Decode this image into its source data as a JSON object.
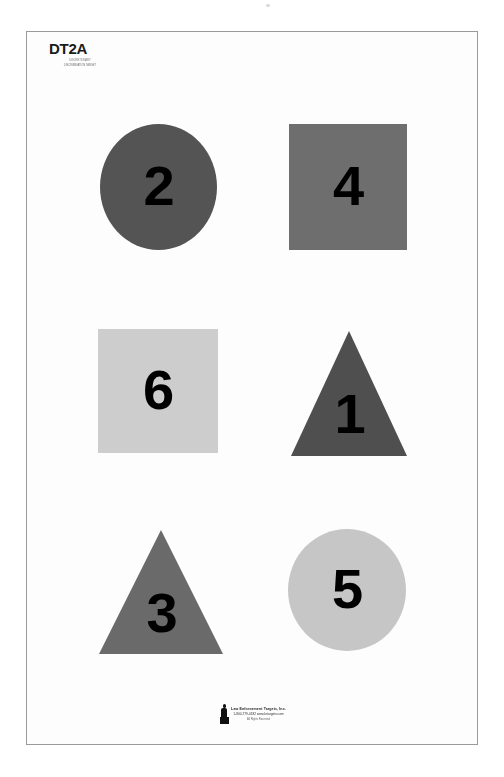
{
  "document": {
    "sheet_code": "DT2A",
    "sheet_subtitle": "DISCRETIONARY\nDISCRIMINATION TARGET",
    "background_color": "#ffffff",
    "sheet_color": "#fdfdfd",
    "sheet_border_color": "#9a9a9a",
    "number_color": "#000000"
  },
  "shapes": [
    {
      "name": "circle-2",
      "shape": "circle",
      "number": "2",
      "fill": "#545454",
      "left": 73,
      "top": 92,
      "width": 117,
      "height": 126,
      "number_top": 34
    },
    {
      "name": "square-4",
      "shape": "square",
      "number": "4",
      "fill": "#6e6e6e",
      "left": 262,
      "top": 92,
      "width": 118,
      "height": 126,
      "number_top": 34
    },
    {
      "name": "square-6",
      "shape": "square",
      "number": "6",
      "fill": "#cdcdcd",
      "left": 71,
      "top": 297,
      "width": 120,
      "height": 124,
      "number_top": 33
    },
    {
      "name": "triangle-1",
      "shape": "triangle",
      "number": "1",
      "fill": "#4f4f4f",
      "left": 264,
      "top": 299,
      "width": 117,
      "height": 125,
      "number_top": 55
    },
    {
      "name": "triangle-3",
      "shape": "triangle",
      "number": "3",
      "fill": "#6a6a6a",
      "left": 72,
      "top": 498,
      "width": 125,
      "height": 124,
      "number_top": 55
    },
    {
      "name": "circle-5",
      "shape": "circle",
      "number": "5",
      "fill": "#c6c6c6",
      "left": 261,
      "top": 497,
      "width": 118,
      "height": 122,
      "number_top": 32
    }
  ],
  "footer": {
    "logo_icon": "person-silhouette-icon",
    "line1": "Law Enforcement Targets, Inc.",
    "line2": "1-800-779-0182  www.letargets.com",
    "line3": "All Rights Reserved"
  }
}
